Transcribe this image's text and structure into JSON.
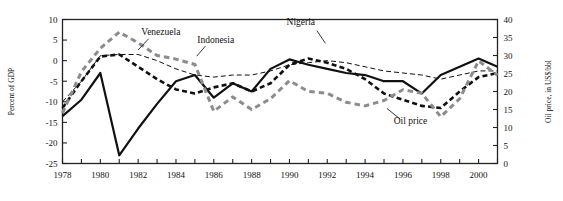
{
  "chart_data": {
    "type": "line",
    "title": "",
    "subtitle": "",
    "xlabel": "",
    "ylabel": "Percent of GDP",
    "y2label": "Oil price, in US$/bbl",
    "grid": false,
    "legend_position": "inline-annotations",
    "xlim": [
      1978,
      2001
    ],
    "ylim": [
      -25,
      10
    ],
    "y2lim": [
      0,
      40
    ],
    "yticks": [
      10,
      5,
      0,
      -5,
      -10,
      -15,
      -20,
      -25
    ],
    "ytick_labels": [
      "10",
      "5",
      "0",
      "-5",
      "-10",
      "-15",
      "-20",
      "-25"
    ],
    "y2ticks": [
      40,
      35,
      30,
      25,
      20,
      15,
      10,
      5,
      0
    ],
    "y2tick_labels": [
      "40",
      "35",
      "30",
      "25",
      "20",
      "15",
      "10",
      "5",
      "0"
    ],
    "xticks": [
      1978,
      1979,
      1980,
      1981,
      1982,
      1983,
      1984,
      1985,
      1986,
      1987,
      1988,
      1989,
      1990,
      1991,
      1992,
      1993,
      1994,
      1995,
      1996,
      1997,
      1998,
      1999,
      2000,
      2001
    ],
    "xtick_labels": [
      "1978",
      "1980",
      "1982",
      "1984",
      "1986",
      "1988",
      "1990",
      "1992",
      "1994",
      "1996",
      "1998",
      "2000"
    ],
    "xtick_labelled": [
      1978,
      1980,
      1982,
      1984,
      1986,
      1988,
      1990,
      1992,
      1994,
      1996,
      1998,
      2000
    ],
    "x": [
      1978,
      1979,
      1980,
      1981,
      1982,
      1983,
      1984,
      1985,
      1986,
      1987,
      1988,
      1989,
      1990,
      1991,
      1992,
      1993,
      1994,
      1995,
      1996,
      1997,
      1998,
      1999,
      2000,
      2001
    ],
    "series": [
      {
        "name": "Nigeria",
        "axis": "left",
        "style": "solid",
        "color": "#111111",
        "width": 2.2,
        "values": [
          -13.5,
          -9.5,
          -3.0,
          -23.0,
          -16.5,
          -10.5,
          -5.0,
          -3.5,
          -9.0,
          -5.5,
          -7.5,
          -2.0,
          0.3,
          -1.0,
          -2.0,
          -3.0,
          -3.5,
          -5.0,
          -5.0,
          -8.0,
          -3.5,
          -1.5,
          0.5,
          -1.5
        ]
      },
      {
        "name": "Venezuela",
        "axis": "left",
        "style": "dashed-bold",
        "color": "#111111",
        "width": 2.6,
        "values": [
          -11.5,
          -5.0,
          1.0,
          1.5,
          -1.5,
          -4.5,
          -7.0,
          -8.0,
          -6.5,
          -5.5,
          -7.5,
          -5.5,
          -1.0,
          0.5,
          -0.5,
          -2.0,
          -4.5,
          -8.0,
          -9.5,
          -11.0,
          -11.5,
          -7.5,
          -4.0,
          -3.0
        ]
      },
      {
        "name": "Indonesia",
        "axis": "left",
        "style": "dashed-thin",
        "color": "#111111",
        "width": 1.0,
        "values": [
          -10.0,
          -5.0,
          1.2,
          1.5,
          1.5,
          0.0,
          -2.0,
          -3.5,
          -4.0,
          -3.5,
          -3.5,
          -2.5,
          -1.0,
          -0.5,
          0.0,
          -0.5,
          -1.5,
          -2.5,
          -3.0,
          -3.5,
          -4.5,
          -3.5,
          -2.5,
          -2.5
        ]
      },
      {
        "name": "Oil price",
        "axis": "right",
        "style": "dashed-gray",
        "color": "#8c8c8c",
        "width": 3.0,
        "values": [
          14.0,
          25.5,
          32.0,
          36.5,
          33.5,
          30.0,
          29.0,
          27.5,
          14.5,
          18.5,
          15.0,
          18.0,
          23.0,
          20.0,
          19.5,
          17.0,
          16.0,
          17.5,
          20.5,
          19.5,
          13.0,
          18.0,
          28.5,
          24.5
        ]
      }
    ],
    "annotations": [
      {
        "text": "Venezuela",
        "x": 1983.2,
        "y": 6.2
      },
      {
        "text": "Indonesia",
        "x": 1986.1,
        "y": 4.4
      },
      {
        "text": "Nigeria",
        "x": 1990.6,
        "y": 8.6
      },
      {
        "text": "Oil price",
        "x": 1996.4,
        "y": -15.4
      }
    ]
  }
}
